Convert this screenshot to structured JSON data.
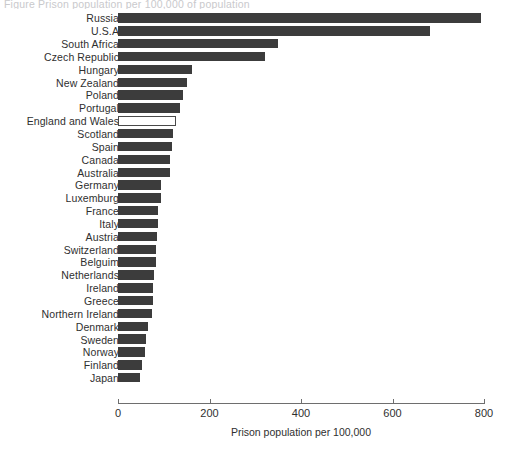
{
  "figure": {
    "clipped_title": "Figure  Prison population per 100,000 of population"
  },
  "chart_data": {
    "type": "bar",
    "orientation": "horizontal",
    "title": "",
    "xlabel": "Prison population per 100,000",
    "ylabel": "",
    "xlim": [
      0,
      800
    ],
    "xticks": [
      0,
      200,
      400,
      600,
      800
    ],
    "xtick_labels": [
      "0",
      "200",
      "400",
      "600",
      "800"
    ],
    "grid": false,
    "legend": null,
    "bar_color": "#3c3c3c",
    "highlight_color": "#ffffff",
    "highlight_category": "England and Wales",
    "categories": [
      "Russia",
      "U.S.A",
      "South Africa",
      "Czech Republic",
      "Hungary",
      "New Zealand",
      "Poland",
      "Portugal",
      "England and Wales",
      "Scotland",
      "Spain",
      "Canada",
      "Australia",
      "Germany",
      "Luxemburg",
      "France",
      "Italy",
      "Austria",
      "Switzerland",
      "Belguim",
      "Netherlands",
      "Ireland",
      "Greece",
      "Northern Ireland",
      "Denmark",
      "Sweden",
      "Norway",
      "Finland",
      "Japan"
    ],
    "values": [
      793,
      682,
      349,
      322,
      162,
      150,
      143,
      135,
      126,
      120,
      117,
      114,
      113,
      94,
      93,
      88,
      87,
      85,
      83,
      82,
      79,
      77,
      76,
      74,
      66,
      61,
      58,
      52,
      48
    ]
  }
}
